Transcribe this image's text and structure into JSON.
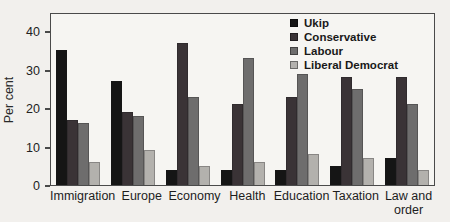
{
  "figure": {
    "background": "#f2f0ed",
    "plot_background": "#f6f5f2",
    "frame_color": "#4a4a4a",
    "text_color": "#1e1e1e"
  },
  "chart_data": {
    "type": "bar",
    "title": "",
    "xlabel": "",
    "ylabel": "Per cent",
    "ylim": [
      0,
      45
    ],
    "yticks": [
      0,
      10,
      20,
      30,
      40
    ],
    "grid": false,
    "legend_position": "top-right-inside",
    "categories": [
      "Immigration",
      "Europe",
      "Economy",
      "Health",
      "Education",
      "Taxation",
      "Law and order"
    ],
    "series": [
      {
        "name": "Ukip",
        "color": "#151515",
        "values": [
          35,
          27,
          4,
          4,
          4,
          5,
          7
        ]
      },
      {
        "name": "Conservative",
        "color": "#3a3336",
        "values": [
          17,
          19,
          37,
          21,
          23,
          28,
          28
        ]
      },
      {
        "name": "Labour",
        "color": "#6e6d6d",
        "values": [
          16,
          18,
          23,
          33,
          29,
          25,
          21
        ]
      },
      {
        "name": "Liberal Democrat",
        "color": "#b3b1ad",
        "values": [
          6,
          9,
          5,
          6,
          8,
          7,
          4
        ]
      }
    ]
  }
}
